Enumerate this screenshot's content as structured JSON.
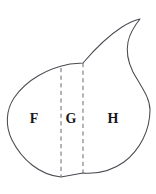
{
  "figure": {
    "background_color": "#ffffff",
    "outline_color": "#4a4a52",
    "divider_color": "#6a6a72",
    "label_color": "#17171a",
    "width": 156,
    "height": 194
  },
  "shape": {
    "name": "teardrop-outline",
    "description": "Closed curve shaped like a leaf or teardrop with a pointed cusp at the upper right",
    "path": "M 61 177 C 40 175 22 160 12 140 C 5 126 6 110 14 98 C 26 80 48 68 70 64 L 83 63 C 94 50 108 36 122 27 C 130 22 136 20 140 19 C 136 24 130 32 128 42 C 126 52 128 62 133 72 C 142 88 150 98 150 110 C 150 130 140 150 124 162 C 110 172 95 174 83 173 L 61 177 Z"
  },
  "dividers": [
    {
      "name": "divider-left",
      "x": 61,
      "y_top": 68,
      "y_bottom": 177,
      "style": "dashed"
    },
    {
      "name": "divider-right",
      "x": 83,
      "y_top": 63,
      "y_bottom": 173,
      "style": "dashed"
    }
  ],
  "labels": [
    {
      "id": "F",
      "text": "F",
      "x": 34,
      "y": 120
    },
    {
      "id": "G",
      "text": "G",
      "x": 71,
      "y": 120
    },
    {
      "id": "H",
      "text": "H",
      "x": 113,
      "y": 120
    }
  ]
}
